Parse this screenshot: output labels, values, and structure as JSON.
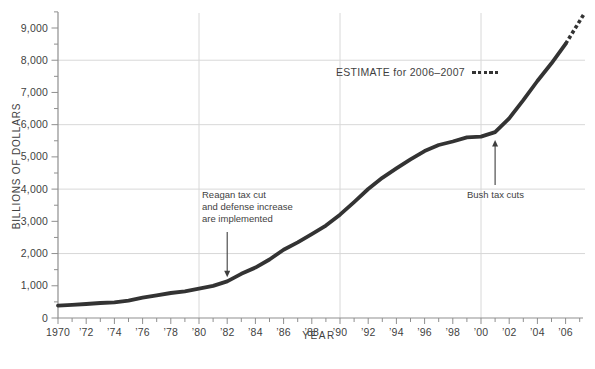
{
  "figure": {
    "colors": {
      "line_color": "#333333",
      "grid_color": "#d8d8d8",
      "axis_color": "#8f8f8f",
      "text_color": "#3f3f3f",
      "background": "#ffffff"
    }
  },
  "chart_data": {
    "type": "line",
    "title": "",
    "xlabel": "YEAR",
    "ylabel": "BILLIONS OF DOLLARS",
    "xlim": [
      1970,
      2007.4
    ],
    "ylim": [
      0,
      9500
    ],
    "grid": "partial",
    "gridlines": {
      "horizontal_at": [
        2000,
        4000,
        6000,
        8000
      ],
      "vertical_at": [
        1980,
        1990,
        2000
      ]
    },
    "x_tick_years": [
      1970,
      1972,
      1974,
      1976,
      1978,
      1980,
      1982,
      1984,
      1986,
      1988,
      1990,
      1992,
      1994,
      1996,
      1998,
      2000,
      2002,
      2004,
      2006
    ],
    "x_tick_labels": [
      "1970",
      "’72",
      "’74",
      "’76",
      "’78",
      "’80",
      "’82",
      "’84",
      "’86",
      "’88",
      "’90",
      "’92",
      "’94",
      "’96",
      "’98",
      "’00",
      "’02",
      "’04",
      "’06"
    ],
    "x_minor_tick_years": [
      1971,
      1973,
      1975,
      1977,
      1979,
      1981,
      1983,
      1985,
      1987,
      1989,
      1991,
      1993,
      1995,
      1997,
      1999,
      2001,
      2003,
      2005,
      2007
    ],
    "y_tick_values": [
      0,
      1000,
      2000,
      3000,
      4000,
      5000,
      6000,
      7000,
      8000,
      9000
    ],
    "y_tick_labels": [
      "0",
      "1,000",
      "2,000",
      "3,000",
      "4,000",
      "5,000",
      "6,000",
      "7,000",
      "8,000",
      "9,000"
    ],
    "y_minor_tick_values": [
      500,
      1500,
      2500,
      3500,
      4500,
      5500,
      6500,
      7500,
      8500,
      9500
    ],
    "series": [
      {
        "name": "national-debt",
        "x": [
          1970,
          1971,
          1972,
          1973,
          1974,
          1975,
          1976,
          1977,
          1978,
          1979,
          1980,
          1981,
          1982,
          1983,
          1984,
          1985,
          1986,
          1987,
          1988,
          1989,
          1990,
          1991,
          1992,
          1993,
          1994,
          1995,
          1996,
          1997,
          1998,
          1999,
          2000,
          2001,
          2002,
          2003,
          2004,
          2005,
          2006
        ],
        "values": [
          381,
          408,
          436,
          466,
          484,
          541,
          629,
          706,
          777,
          829,
          909,
          995,
          1137,
          1372,
          1565,
          1817,
          2121,
          2346,
          2601,
          2868,
          3206,
          3598,
          4002,
          4351,
          4643,
          4921,
          5181,
          5369,
          5478,
          5606,
          5629,
          5770,
          6198,
          6760,
          7355,
          7905,
          8507
        ]
      }
    ],
    "estimate": {
      "label": "ESTIMATE for 2006–2007",
      "style": "dashed",
      "x": [
        2006,
        2007.3
      ],
      "values": [
        8507,
        9430
      ]
    },
    "annotations": [
      {
        "id": "reagan",
        "text": "Reagan tax cut\nand defense increase\nare implemented",
        "arrow_direction": "down",
        "points_to": {
          "year": 1982,
          "value": 1137
        }
      },
      {
        "id": "bush",
        "text": "Bush tax cuts",
        "arrow_direction": "up",
        "points_to": {
          "year": 2001,
          "value": 5770
        }
      }
    ]
  }
}
